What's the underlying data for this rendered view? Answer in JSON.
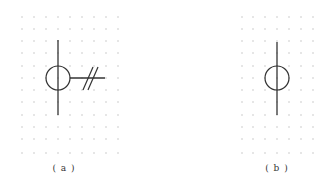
{
  "panels": [
    {
      "id": "a",
      "label": "( a )",
      "grid": {
        "xs": [
          22,
          34,
          46,
          58,
          70,
          82,
          94,
          106,
          118
        ],
        "ys": [
          17,
          29,
          41,
          53,
          66,
          78,
          90,
          102,
          115,
          127,
          139,
          153
        ]
      },
      "symbol": {
        "type": "circle-with-vertical-line-and-double-slash-branch",
        "center": [
          58,
          78
        ],
        "radius": 12,
        "vertical_line": [
          40,
          115
        ],
        "horizontal_branch": [
          70,
          105
        ],
        "slashes": [
          [
            [
              83,
              90
            ],
            [
              93,
              67
            ]
          ],
          [
            [
              88,
              90
            ],
            [
              98,
              67
            ]
          ]
        ]
      },
      "label_pos": [
        64,
        170
      ]
    },
    {
      "id": "b",
      "label": "( b )",
      "grid": {
        "xs": [
          242,
          253,
          265,
          277,
          289,
          301,
          313
        ],
        "ys": [
          17,
          29,
          41,
          53,
          66,
          78,
          90,
          102,
          115,
          127,
          139,
          153
        ]
      },
      "symbol": {
        "type": "circle-with-vertical-line",
        "center": [
          277,
          78
        ],
        "radius": 12,
        "vertical_line": [
          42,
          115
        ]
      },
      "label_pos": [
        277,
        170
      ]
    }
  ],
  "colors": {
    "line": "#333333",
    "dot": "#9a9a9a"
  }
}
